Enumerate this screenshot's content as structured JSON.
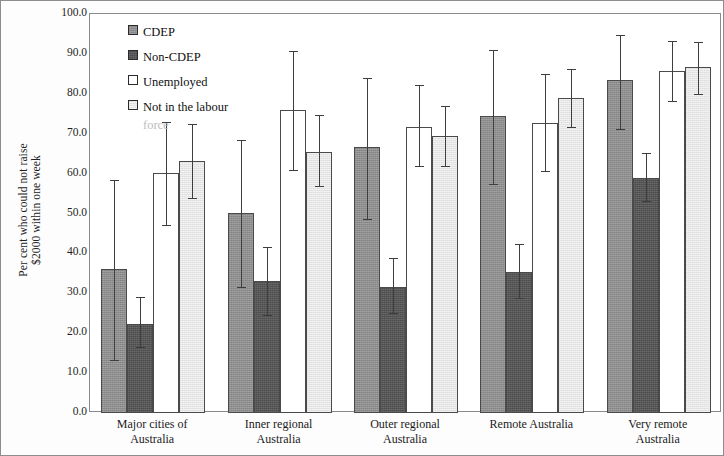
{
  "chart_data": {
    "type": "bar",
    "title": "",
    "subtitle": "",
    "xlabel": "",
    "ylabel": "Per cent who could not raise\n$2000 within one week",
    "ylim": [
      0,
      100
    ],
    "ytick_labels": [
      "100.0",
      "90.0",
      "80.0",
      "70.0",
      "60.0",
      "50.0",
      "40.0",
      "30.0",
      "20.0",
      "10.0",
      "0.0"
    ],
    "ytick_values": [
      100,
      90,
      80,
      70,
      60,
      50,
      40,
      30,
      20,
      10,
      0
    ],
    "grid": false,
    "legend_position": "top-left",
    "error_bars": "95% confidence interval",
    "categories": [
      "Major cities of\nAustralia",
      "Inner regional\nAustralia",
      "Outer regional\nAustralia",
      "Remote Australia",
      "Very remote\nAustralia"
    ],
    "series": [
      {
        "name": "CDEP",
        "swatch": "#8e8e8e",
        "values": [
          36.0,
          50.2,
          66.6,
          74.4,
          83.5
        ],
        "err_low": [
          13.4,
          31.5,
          48.6,
          57.3,
          71.2
        ],
        "err_high": [
          58.4,
          68.5,
          84.0,
          91.0,
          94.8
        ]
      },
      {
        "name": "Non-CDEP",
        "swatch": "#4c4c4c",
        "values": [
          22.4,
          33.0,
          31.6,
          35.4,
          58.8
        ],
        "err_low": [
          16.6,
          24.5,
          25.0,
          28.8,
          53.2
        ],
        "err_high": [
          29.0,
          41.5,
          38.8,
          42.4,
          65.2
        ]
      },
      {
        "name": "Unemployed",
        "swatch": "#ffffff",
        "values": [
          60.2,
          76.0,
          71.8,
          72.8,
          85.8
        ],
        "err_low": [
          47.0,
          61.0,
          61.8,
          60.6,
          78.2
        ],
        "err_high": [
          73.0,
          90.8,
          82.2,
          85.0,
          93.2
        ]
      },
      {
        "name": "Not in the labour",
        "name_line2": "force",
        "swatch": "#e6e6e6",
        "values": [
          63.2,
          65.5,
          69.4,
          79.0,
          86.6
        ],
        "err_low": [
          54.0,
          56.8,
          62.0,
          71.6,
          80.0
        ],
        "err_high": [
          72.4,
          74.6,
          77.0,
          86.2,
          93.0
        ]
      }
    ]
  },
  "legend": {
    "items": [
      {
        "label": "CDEP",
        "sublabel": ""
      },
      {
        "label": "Non-CDEP",
        "sublabel": ""
      },
      {
        "label": "Unemployed",
        "sublabel": ""
      },
      {
        "label": "Not in the labour",
        "sublabel": "force"
      }
    ]
  }
}
